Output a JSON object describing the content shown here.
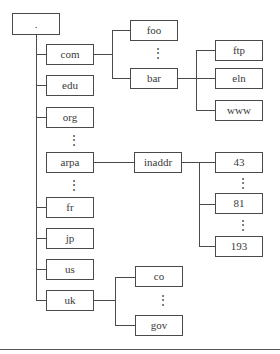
{
  "diagram": {
    "title": "",
    "root": {
      "label": "."
    },
    "top_level": [
      {
        "label": "com"
      },
      {
        "label": "edu"
      },
      {
        "label": "org"
      },
      {
        "label": "arpa"
      },
      {
        "label": "fr"
      },
      {
        "label": "jp"
      },
      {
        "label": "us"
      },
      {
        "label": "uk"
      }
    ],
    "com_children": [
      {
        "label": "foo"
      },
      {
        "label": "bar"
      }
    ],
    "bar_children": [
      {
        "label": "ftp"
      },
      {
        "label": "eln"
      },
      {
        "label": "www"
      }
    ],
    "arpa_children": [
      {
        "label": "inaddr"
      }
    ],
    "inaddr_children": [
      {
        "label": "43"
      },
      {
        "label": "81"
      },
      {
        "label": "193"
      }
    ],
    "uk_children": [
      {
        "label": "co"
      },
      {
        "label": "gov"
      }
    ],
    "ellipsis": "⋮",
    "colors": {
      "line": "#4a4a4a",
      "text": "#3a3a3a",
      "background": "#ffffff"
    }
  }
}
